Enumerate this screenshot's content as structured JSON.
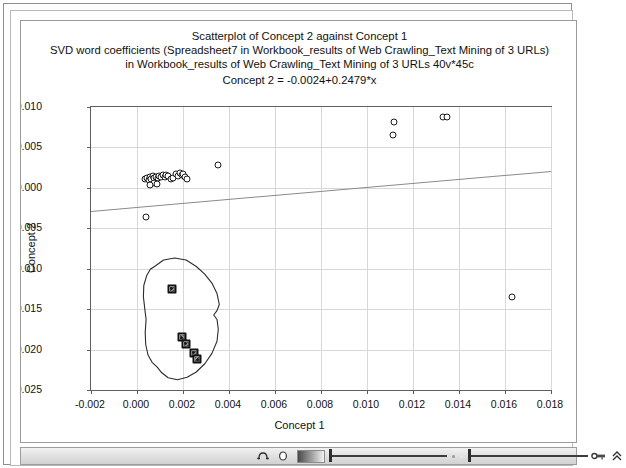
{
  "window": {
    "title_lines": [
      "Scatterplot of Concept 2 against Concept 1",
      "SVD word coefficients (Spreadsheet7 in Workbook_results of Web Crawling_Text Mining of 3 URLs)",
      "in Workbook_results of Web Crawling_Text Mining of 3 URLs 40v*45c",
      "Concept 2 = -0.0024+0.2479*x"
    ]
  },
  "toolbar": {
    "icons": [
      {
        "name": "magnifier-icon",
        "glyph": "⌕"
      },
      {
        "name": "circle-icon",
        "glyph": "○"
      },
      {
        "name": "gradient-swatch",
        "glyph": ""
      },
      {
        "name": "brightness-slider",
        "glyph": ""
      },
      {
        "name": "contrast-slider",
        "glyph": ""
      },
      {
        "name": "key-icon",
        "glyph": "⚷"
      },
      {
        "name": "scroll-up-icon",
        "glyph": "⌃"
      }
    ]
  },
  "chart_data": {
    "type": "scatter",
    "title": "Scatterplot of Concept 2 against Concept 1",
    "subtitle": "SVD word coefficients (Spreadsheet7 in Workbook_results of Web Crawling_Text Mining of 3 URLs) in Workbook_results of Web Crawling_Text Mining of 3 URLs 40v*45c",
    "equation": "Concept 2 = -0.0024+0.2479*x",
    "xlabel": "Concept 1",
    "ylabel": "Concept 2",
    "xlim": [
      -0.002,
      0.018
    ],
    "ylim": [
      -0.025,
      0.01
    ],
    "xticks": [
      -0.002,
      0.0,
      0.002,
      0.004,
      0.006,
      0.008,
      0.01,
      0.012,
      0.014,
      0.016,
      0.018
    ],
    "xticklabels": [
      "-0.002",
      "0.000",
      "0.002",
      "0.004",
      "0.006",
      "0.008",
      "0.010",
      "0.012",
      "0.014",
      "0.016",
      "0.018"
    ],
    "yticks": [
      0.01,
      0.005,
      0.0,
      -0.005,
      -0.01,
      -0.015,
      -0.02,
      -0.025
    ],
    "yticklabels": [
      "0.010",
      "0.005",
      "0.000",
      "-0.005",
      "-0.010",
      "-0.015",
      "-0.020",
      "-0.025"
    ],
    "grid": true,
    "legend": false,
    "fit": {
      "intercept": -0.0024,
      "slope": 0.2479,
      "style": "solid",
      "color": "#8a8a8a"
    },
    "series": [
      {
        "name": "open-markers",
        "marker": "open-circle",
        "color": "#1b1b1b",
        "points": [
          [
            0.00035,
            0.00105
          ],
          [
            0.00045,
            0.0012
          ],
          [
            0.0005,
            0.00095
          ],
          [
            0.00058,
            0.00135
          ],
          [
            0.00062,
            0.00115
          ],
          [
            0.0007,
            0.0015
          ],
          [
            0.00076,
            0.00125
          ],
          [
            0.00082,
            0.0014
          ],
          [
            0.0009,
            0.00118
          ],
          [
            0.00096,
            0.00148
          ],
          [
            0.00104,
            0.00132
          ],
          [
            0.00112,
            0.00155
          ],
          [
            0.0012,
            0.00138
          ],
          [
            0.00128,
            0.0016
          ],
          [
            0.00136,
            0.00142
          ],
          [
            0.00148,
            0.00112
          ],
          [
            0.00158,
            0.00128
          ],
          [
            0.0017,
            0.00168
          ],
          [
            0.00178,
            0.0015
          ],
          [
            0.00186,
            0.00178
          ],
          [
            0.00194,
            0.00158
          ],
          [
            0.00202,
            0.00172
          ],
          [
            0.0021,
            0.0013
          ],
          [
            0.00218,
            0.00108
          ],
          [
            0.00072,
            0.00062
          ],
          [
            0.00085,
            0.00045
          ],
          [
            0.00058,
            0.0004
          ],
          [
            0.0004,
            -0.0036
          ],
          [
            0.0035,
            0.0028
          ],
          [
            0.01118,
            0.0082
          ],
          [
            0.01112,
            0.00648
          ],
          [
            0.01332,
            0.0088
          ],
          [
            0.01348,
            0.0088
          ],
          [
            0.01632,
            -0.01352
          ]
        ]
      },
      {
        "name": "selected-markers",
        "marker": "filled-square",
        "color": "#111111",
        "points": [
          [
            0.00152,
            -0.01245
          ],
          [
            0.00195,
            -0.01845
          ],
          [
            0.00212,
            -0.01925
          ],
          [
            0.00246,
            -0.0204
          ],
          [
            0.00262,
            -0.0212
          ]
        ]
      }
    ],
    "annotations": [
      {
        "name": "lasso-outline",
        "type": "freehand-polygon",
        "points": [
          [
            0.00085,
            -0.00975
          ],
          [
            0.0012,
            -0.00905
          ],
          [
            0.00168,
            -0.0088
          ],
          [
            0.00218,
            -0.00905
          ],
          [
            0.00262,
            -0.00985
          ],
          [
            0.00298,
            -0.01075
          ],
          [
            0.0033,
            -0.0119
          ],
          [
            0.00352,
            -0.0132
          ],
          [
            0.00362,
            -0.01455
          ],
          [
            0.00352,
            -0.0153
          ],
          [
            0.00338,
            -0.01585
          ],
          [
            0.00352,
            -0.0164
          ],
          [
            0.00358,
            -0.0176
          ],
          [
            0.00352,
            -0.0191
          ],
          [
            0.0033,
            -0.0206
          ],
          [
            0.003,
            -0.02185
          ],
          [
            0.00262,
            -0.0229
          ],
          [
            0.00222,
            -0.02355
          ],
          [
            0.0018,
            -0.02385
          ],
          [
            0.0014,
            -0.0236
          ],
          [
            0.00112,
            -0.023
          ],
          [
            0.00092,
            -0.0223
          ],
          [
            0.0007,
            -0.0217
          ],
          [
            0.00052,
            -0.0208
          ],
          [
            0.00042,
            -0.0195
          ],
          [
            0.0004,
            -0.018
          ],
          [
            0.00044,
            -0.0164
          ],
          [
            0.00038,
            -0.015
          ],
          [
            0.00032,
            -0.0136
          ],
          [
            0.00034,
            -0.0122
          ],
          [
            0.00046,
            -0.011
          ],
          [
            0.00062,
            -0.0102
          ]
        ]
      }
    ]
  }
}
